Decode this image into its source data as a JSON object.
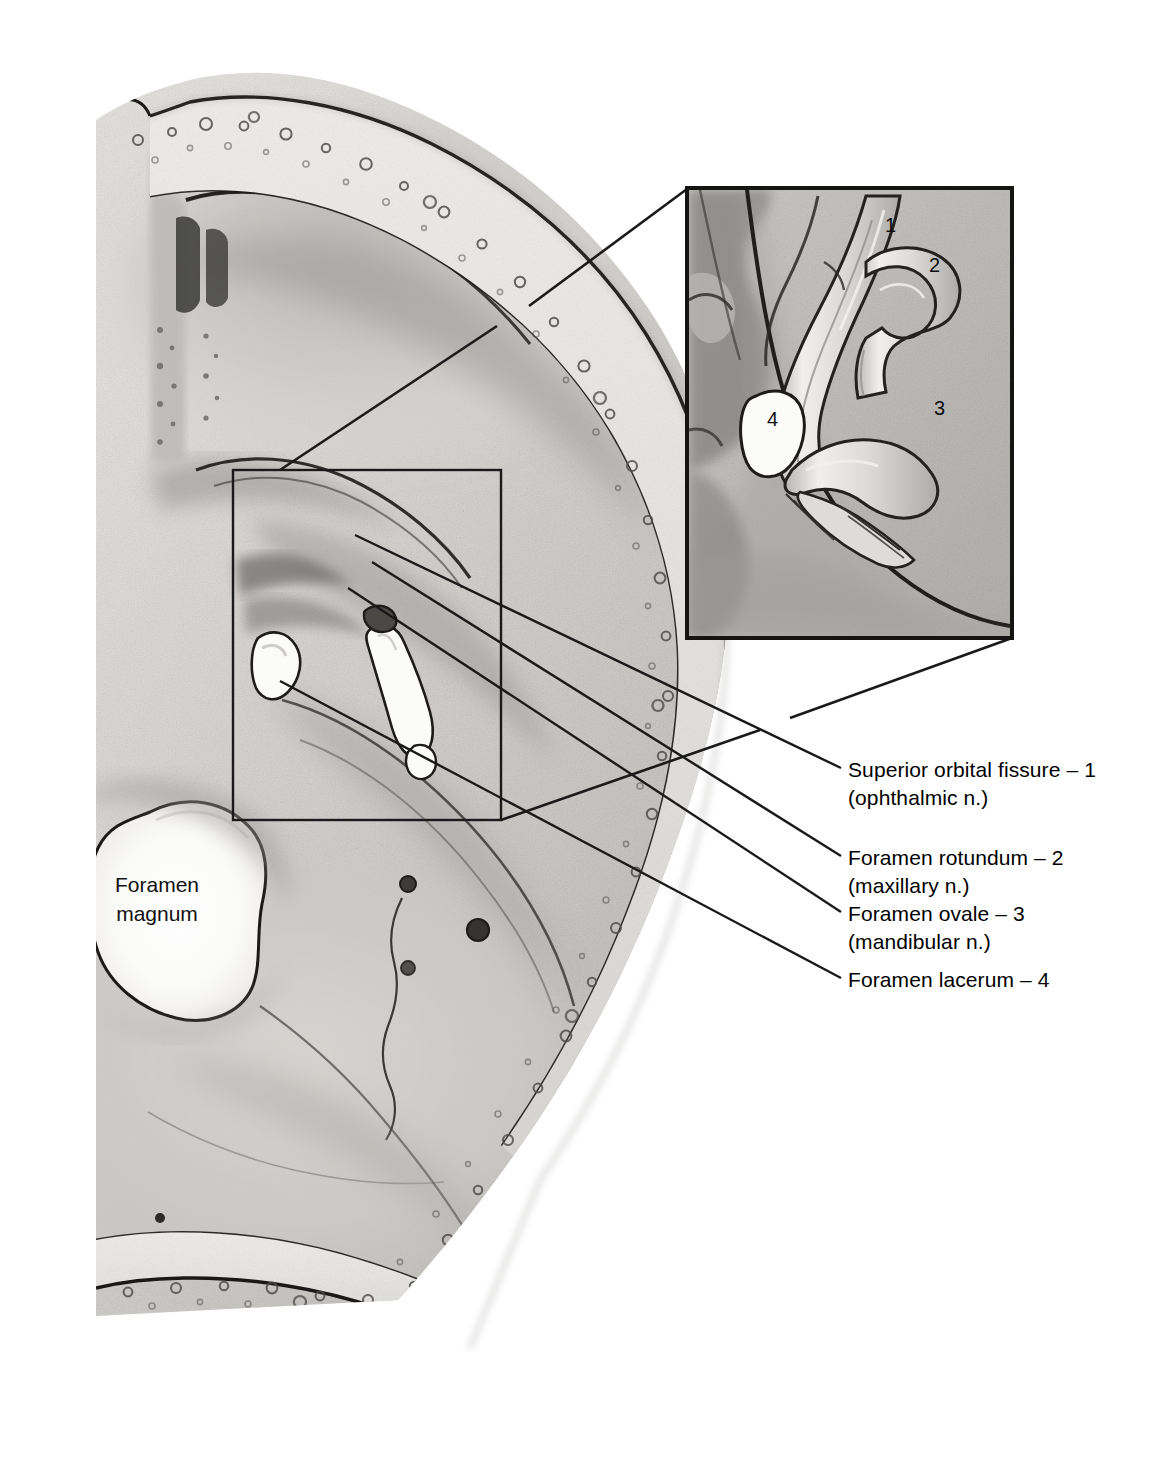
{
  "figure": {
    "type": "anatomical-illustration",
    "medium": "grayscale pencil drawing"
  },
  "inline_labels": {
    "foramen_magnum": {
      "line1": "Foramen",
      "line2": "magnum"
    }
  },
  "leader_labels": [
    {
      "id": "superior-orbital-fissure",
      "line1": "Superior orbital fissure – 1",
      "line2": "(ophthalmic n.)",
      "number": "1"
    },
    {
      "id": "foramen-rotundum",
      "line1": "Foramen rotundum – 2",
      "line2": "(maxillary n.)",
      "number": "2"
    },
    {
      "id": "foramen-ovale",
      "line1": "Foramen ovale – 3",
      "line2": "(mandibular n.)",
      "number": "3"
    },
    {
      "id": "foramen-lacerum",
      "line1": "Foramen lacerum – 4",
      "line2": "",
      "number": "4"
    }
  ],
  "inset": {
    "title": "magnified detail of middle cranial fossa foramina",
    "markers": [
      {
        "number": "1",
        "refers_to": "Superior orbital fissure (ophthalmic n.)"
      },
      {
        "number": "2",
        "refers_to": "Foramen rotundum (maxillary n.)"
      },
      {
        "number": "3",
        "refers_to": "Foramen ovale (mandibular n.)"
      },
      {
        "number": "4",
        "refers_to": "Foramen lacerum"
      }
    ]
  },
  "colors": {
    "background": "#ffffff",
    "ink": "#1a1a1a",
    "bone_light": "#e9e8e6",
    "bone_mid": "#c2c0bd",
    "bone_dark": "#8e8c89",
    "shadow": "#6a6967",
    "aperture_white": "#fbfbfa"
  }
}
